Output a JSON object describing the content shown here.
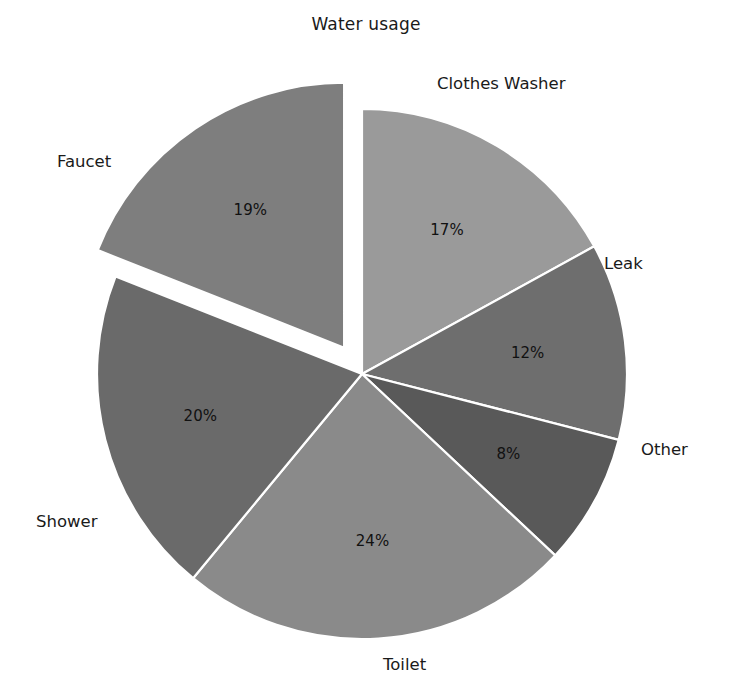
{
  "chart_data": {
    "type": "pie",
    "title": "Water usage",
    "xlabel": "",
    "ylabel": "",
    "legend_position": "none",
    "grid": false,
    "labels": [
      "Clothes Washer",
      "Leak",
      "Other",
      "Toilet",
      "Shower",
      "Faucet"
    ],
    "values": [
      17,
      12,
      8,
      24,
      20,
      19
    ],
    "value_labels": [
      "17%",
      "12%",
      "8%",
      "24%",
      "20%",
      "19%"
    ],
    "units": "percent",
    "total": 100,
    "start_angle_deg": 90,
    "direction": "clockwise",
    "exploded": [
      "Faucet"
    ],
    "explode_offset": 0.12,
    "slice_colors": [
      "#9a9a9a",
      "#6e6e6e",
      "#595959",
      "#8a8a8a",
      "#6a6a6a",
      "#7e7e7e"
    ],
    "wedge_edge_color": "#ffffff",
    "background_color": "#ffffff",
    "slices": [
      {
        "name": "Clothes Washer",
        "value": 17,
        "value_label": "17%",
        "color": "#9a9a9a",
        "exploded": false
      },
      {
        "name": "Leak",
        "value": 12,
        "value_label": "12%",
        "color": "#6e6e6e",
        "exploded": false
      },
      {
        "name": "Other",
        "value": 8,
        "value_label": "8%",
        "color": "#595959",
        "exploded": false
      },
      {
        "name": "Toilet",
        "value": 24,
        "value_label": "24%",
        "color": "#8a8a8a",
        "exploded": false
      },
      {
        "name": "Shower",
        "value": 20,
        "value_label": "20%",
        "color": "#6a6a6a",
        "exploded": false
      },
      {
        "name": "Faucet",
        "value": 19,
        "value_label": "19%",
        "color": "#7e7e7e",
        "exploded": true
      }
    ]
  }
}
